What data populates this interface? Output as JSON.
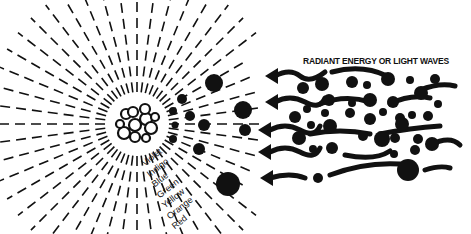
{
  "diagram": {
    "title": "RADIANT ENERGY OR LIGHT WAVES",
    "spectrum_labels": [
      "Violet",
      "Indigo",
      "Blue",
      "Green",
      "Yellow",
      "Orange",
      "Red"
    ],
    "colors": {
      "ink": "#111111",
      "background": "#ffffff"
    },
    "elements": {
      "source": "sun-cluster",
      "rays": "radiating-dashed-lines",
      "particles": "black-dots",
      "waves": "wavy-arrows-pointing-left"
    }
  }
}
